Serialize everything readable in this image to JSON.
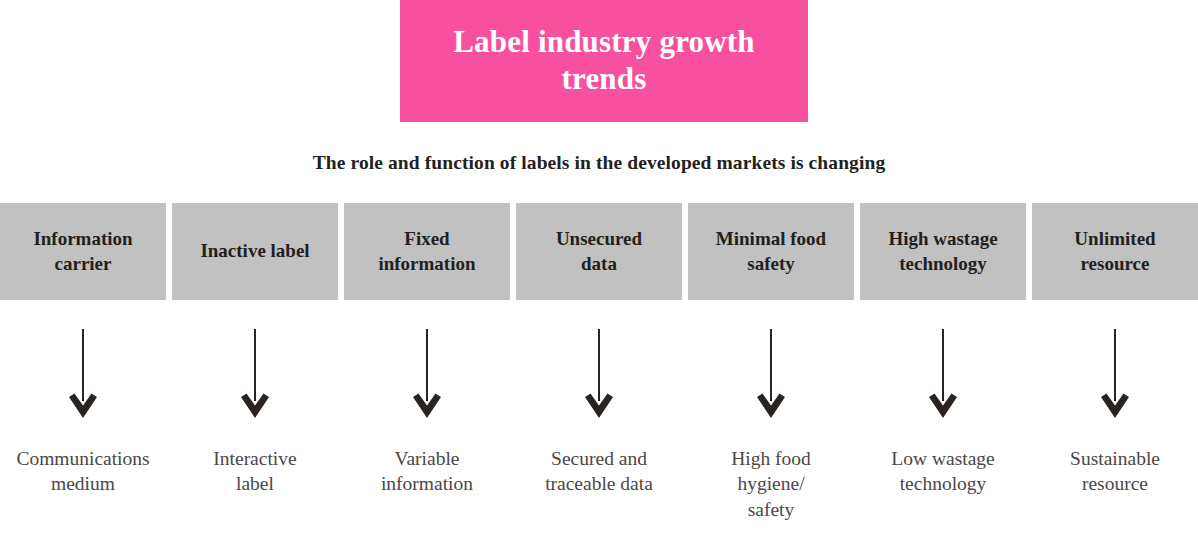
{
  "title": {
    "text": "Label industry growth trends",
    "background_color": "#f7509e",
    "text_color": "#ffffff"
  },
  "subtitle": {
    "text": "The role and function of labels in the developed markets is changing"
  },
  "theme": {
    "box_color": "#c1c1c1",
    "box_text_color": "#231f1c",
    "arrow_color": "#2b2320",
    "outcome_text_color": "#4b4745",
    "page_background": "#ffffff"
  },
  "columns": [
    {
      "from": "Information\ncarrier",
      "to": "Communications\nmedium",
      "arrow": "down-arrow-icon"
    },
    {
      "from": "Inactive label",
      "to": "Interactive\nlabel",
      "arrow": "down-arrow-icon"
    },
    {
      "from": "Fixed\ninformation",
      "to": "Variable\ninformation",
      "arrow": "down-arrow-icon"
    },
    {
      "from": "Unsecured\ndata",
      "to": "Secured and\ntraceable data",
      "arrow": "down-arrow-icon"
    },
    {
      "from": "Minimal food\nsafety",
      "to": "High food\nhygiene/\nsafety",
      "arrow": "down-arrow-icon"
    },
    {
      "from": "High wastage\ntechnology",
      "to": "Low wastage\ntechnology",
      "arrow": "down-arrow-icon"
    },
    {
      "from": "Unlimited\nresource",
      "to": "Sustainable\nresource",
      "arrow": "down-arrow-icon"
    }
  ]
}
